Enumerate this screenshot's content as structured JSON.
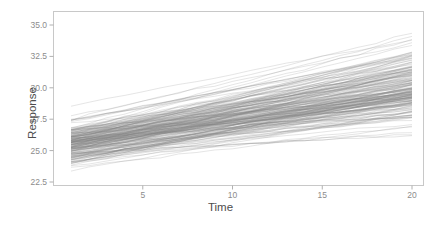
{
  "chart_data": {
    "type": "line",
    "title": "",
    "subtitle": "",
    "xlabel": "Time",
    "ylabel": "Response",
    "xlim": [
      1,
      20
    ],
    "ylim": [
      22.5,
      35.8
    ],
    "xticks": [
      5,
      10,
      15,
      20
    ],
    "xtick_labels": [
      "5",
      "10",
      "15",
      "20"
    ],
    "yticks": [
      22.5,
      25.0,
      27.5,
      30.0,
      32.5,
      35.0
    ],
    "ytick_labels": [
      "22.5",
      "25.0",
      "27.5",
      "30.0",
      "32.5",
      "35.0"
    ],
    "grid": false,
    "legend": false,
    "legend_position": "none",
    "n_series": 200,
    "series_description": "Individual subject trajectories (spaghetti plot) with random intercepts and random slopes; response increases approximately linearly with time.",
    "line_color": "#808080",
    "line_opacity": 0.35,
    "line_width": 0.6,
    "x_values": [
      1,
      2,
      3,
      4,
      5,
      6,
      7,
      8,
      9,
      10,
      11,
      12,
      13,
      14,
      15,
      16,
      17,
      18,
      19,
      20
    ],
    "intercept_range_at_t1": [
      22.9,
      27.7
    ],
    "intercept_mean_at_t1": 25.5,
    "value_range_at_t20": [
      24.6,
      35.7
    ],
    "value_mean_at_t20": 29.8,
    "mean_slope_per_unit_time": 0.23,
    "slope_range_per_unit_time": [
      0.07,
      0.45
    ]
  },
  "panel": {
    "background_color": "#ffffff",
    "border_color": "#c8c8c8",
    "tick_color": "#b0b0b0",
    "tick_text_color": "#8c8c8c",
    "axis_title_color": "#4d4d4d"
  }
}
